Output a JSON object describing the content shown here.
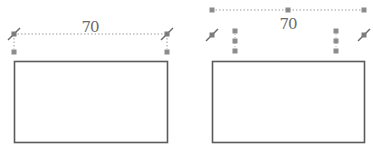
{
  "colors": {
    "outline": "#5a5a5a",
    "dotted_line": "#9a9a9a",
    "handle_fill": "#8c8c8c",
    "label": "#6a6a6a",
    "background": "#ffffff"
  },
  "panels": [
    {
      "name": "before",
      "dimension": {
        "label": "70",
        "orientation": "horizontal",
        "style": "dotted",
        "endpoint_glyph": "diagonal-slash-square"
      },
      "rectangle": {
        "width_units": "70"
      },
      "handles": {
        "leader_squares": 2
      }
    },
    {
      "name": "after",
      "dimension": {
        "label": "70",
        "orientation": "horizontal",
        "style": "dotted",
        "endpoint_glyph": "square"
      },
      "rectangle": {
        "width_units": "70"
      },
      "handles": {
        "top_line_squares": 3,
        "vertical_stack_squares_each": 3,
        "diagonal_glyphs": 2
      }
    }
  ],
  "labels": {
    "left_dimension": "70",
    "right_dimension": "70"
  }
}
